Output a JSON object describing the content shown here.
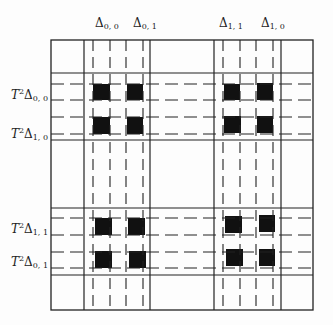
{
  "diagram": {
    "frame": {
      "left": 51,
      "top": 40,
      "right": 313,
      "bottom": 310
    },
    "colors": {
      "line": "#222222",
      "fill": "#111111",
      "background": "#fdfdfd"
    },
    "top_labels": [
      {
        "id": "d00",
        "symbol": "Δ",
        "sub": "0, 0",
        "x": 95,
        "y": 17
      },
      {
        "id": "d01",
        "symbol": "Δ",
        "sub": "0, 1",
        "x": 133,
        "y": 17
      },
      {
        "id": "d11",
        "symbol": "Δ",
        "sub": "1, 1",
        "x": 219,
        "y": 17
      },
      {
        "id": "d10",
        "symbol": "Δ",
        "sub": "1, 0",
        "x": 261,
        "y": 17
      }
    ],
    "side_labels": [
      {
        "id": "t2d00",
        "prefix": "T",
        "sup": "2",
        "symbol": "Δ",
        "sub": "0, 0",
        "y": 96
      },
      {
        "id": "t2d10",
        "prefix": "T",
        "sup": "2",
        "symbol": "Δ",
        "sub": "1, 0",
        "y": 135
      },
      {
        "id": "t2d11",
        "prefix": "T",
        "sup": "2",
        "symbol": "Δ",
        "sub": "1, 1",
        "y": 230
      },
      {
        "id": "t2d01",
        "prefix": "T",
        "sup": "2",
        "symbol": "Δ",
        "sub": "0, 1",
        "y": 263
      }
    ],
    "vertical_lines": [
      {
        "x": 84,
        "style": "solid"
      },
      {
        "x": 93,
        "style": "dashed"
      },
      {
        "x": 110,
        "style": "dashed"
      },
      {
        "x": 126,
        "style": "dashed"
      },
      {
        "x": 143,
        "style": "dashed"
      },
      {
        "x": 150,
        "style": "solid"
      },
      {
        "x": 214,
        "style": "solid"
      },
      {
        "x": 223,
        "style": "dashed"
      },
      {
        "x": 240,
        "style": "dashed"
      },
      {
        "x": 256,
        "style": "dashed"
      },
      {
        "x": 273,
        "style": "dashed"
      },
      {
        "x": 281,
        "style": "solid"
      }
    ],
    "horizontal_lines": [
      {
        "y": 73,
        "style": "solid"
      },
      {
        "y": 84,
        "style": "dashed"
      },
      {
        "y": 100,
        "style": "dashed"
      },
      {
        "y": 117,
        "style": "dashed"
      },
      {
        "y": 134,
        "style": "dashed"
      },
      {
        "y": 140,
        "style": "solid"
      },
      {
        "y": 208,
        "style": "solid"
      },
      {
        "y": 218,
        "style": "dashed"
      },
      {
        "y": 235,
        "style": "dashed"
      },
      {
        "y": 252,
        "style": "dashed"
      },
      {
        "y": 268,
        "style": "dashed"
      },
      {
        "y": 275,
        "style": "solid"
      }
    ],
    "black_squares": [
      {
        "x": 93,
        "y": 84,
        "w": 17,
        "h": 16
      },
      {
        "x": 127,
        "y": 84,
        "w": 16,
        "h": 16
      },
      {
        "x": 93,
        "y": 117,
        "w": 17,
        "h": 17
      },
      {
        "x": 127,
        "y": 117,
        "w": 16,
        "h": 17
      },
      {
        "x": 224,
        "y": 84,
        "w": 16,
        "h": 16
      },
      {
        "x": 257,
        "y": 83,
        "w": 16,
        "h": 17
      },
      {
        "x": 224,
        "y": 116,
        "w": 17,
        "h": 17
      },
      {
        "x": 257,
        "y": 116,
        "w": 16,
        "h": 17
      },
      {
        "x": 95,
        "y": 218,
        "w": 17,
        "h": 17
      },
      {
        "x": 128,
        "y": 218,
        "w": 17,
        "h": 17
      },
      {
        "x": 95,
        "y": 251,
        "w": 17,
        "h": 17
      },
      {
        "x": 129,
        "y": 251,
        "w": 17,
        "h": 17
      },
      {
        "x": 225,
        "y": 216,
        "w": 17,
        "h": 17
      },
      {
        "x": 259,
        "y": 215,
        "w": 16,
        "h": 17
      },
      {
        "x": 226,
        "y": 249,
        "w": 17,
        "h": 17
      },
      {
        "x": 259,
        "y": 249,
        "w": 16,
        "h": 17
      }
    ]
  }
}
